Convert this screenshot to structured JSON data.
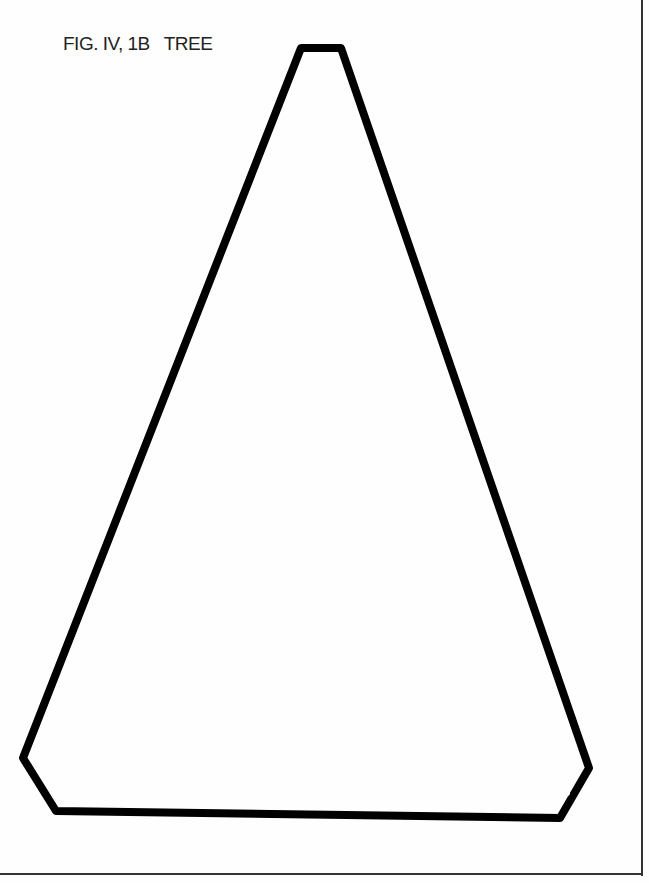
{
  "figure": {
    "caption": "FIG. IV, 1B   TREE",
    "shape_label": "tree-template-outline",
    "stroke_color": "#000000",
    "border_color": "#333333"
  }
}
